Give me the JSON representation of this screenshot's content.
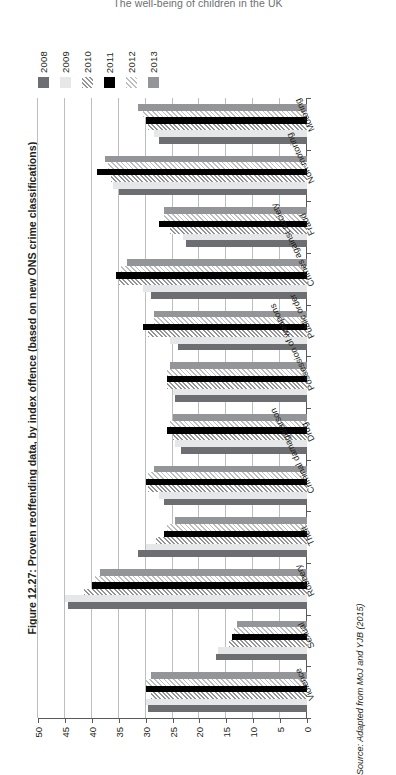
{
  "running_head": "The well-being of children in the UK",
  "figure": {
    "caption": "Figure 12.27: Proven reoffending data, by index offence (based on new ONS crime classifications)",
    "source": "Source: Adapted from MoJ and YJB (2015)"
  },
  "legend": {
    "entries": [
      {
        "label": "2008",
        "swatch": "solid-dark-gray",
        "color": "#6d6e71"
      },
      {
        "label": "2009",
        "swatch": "solid-very-light",
        "color": "#e6e7e8"
      },
      {
        "label": "2010",
        "swatch": "diagonal-hatch-dark",
        "color": "#a7a9ac"
      },
      {
        "label": "2011",
        "swatch": "solid-black",
        "color": "#000000"
      },
      {
        "label": "2012",
        "swatch": "diagonal-hatch-light",
        "color": "#d1d3d4"
      },
      {
        "label": "2013",
        "swatch": "solid-mid-gray",
        "color": "#939598"
      }
    ]
  },
  "axis": {
    "ticks": [
      "50",
      "45",
      "40",
      "35",
      "30",
      "25",
      "20",
      "15",
      "10",
      "5",
      "0"
    ],
    "min": 0,
    "max": 50,
    "step": 5,
    "reversed": true
  },
  "chart_data": {
    "type": "bar",
    "orientation": "horizontal",
    "title": "Proven reoffending data, by index offence (based on new ONS crime classifications)",
    "xlabel": "",
    "ylabel": "",
    "xlim": [
      0,
      50
    ],
    "x_axis_reversed": true,
    "grid": true,
    "legend_position": "top-left",
    "categories": [
      "Violence",
      "Sexual",
      "Robbery",
      "Theft",
      "Criminal damage/arson",
      "Drug",
      "Possession of weapons",
      "Public order",
      "Crimes against society",
      "Fraud",
      "Non-motoring",
      "Motoring"
    ],
    "series": [
      {
        "name": "2008",
        "values": [
          29.5,
          17.0,
          44.5,
          31.5,
          26.5,
          23.5,
          24.5,
          24.0,
          29.0,
          22.5,
          35.0,
          27.5
        ]
      },
      {
        "name": "2009",
        "values": [
          30.0,
          16.5,
          45.0,
          30.0,
          27.5,
          24.5,
          25.0,
          25.5,
          30.5,
          23.0,
          36.0,
          28.5
        ]
      },
      {
        "name": "2010",
        "values": [
          29.0,
          14.5,
          41.5,
          28.0,
          29.5,
          25.0,
          26.0,
          29.5,
          35.0,
          25.5,
          36.5,
          29.5
        ]
      },
      {
        "name": "2011",
        "values": [
          30.0,
          14.0,
          40.0,
          26.5,
          30.0,
          26.0,
          26.0,
          30.5,
          35.5,
          27.5,
          39.0,
          30.0
        ]
      },
      {
        "name": "2012",
        "values": [
          30.0,
          13.5,
          39.5,
          26.0,
          29.5,
          25.5,
          26.0,
          28.5,
          34.5,
          26.5,
          37.0,
          30.5
        ]
      },
      {
        "name": "2013",
        "values": [
          29.0,
          13.0,
          38.5,
          24.5,
          28.5,
          25.0,
          25.5,
          28.5,
          33.5,
          26.5,
          37.5,
          31.5
        ]
      }
    ]
  }
}
